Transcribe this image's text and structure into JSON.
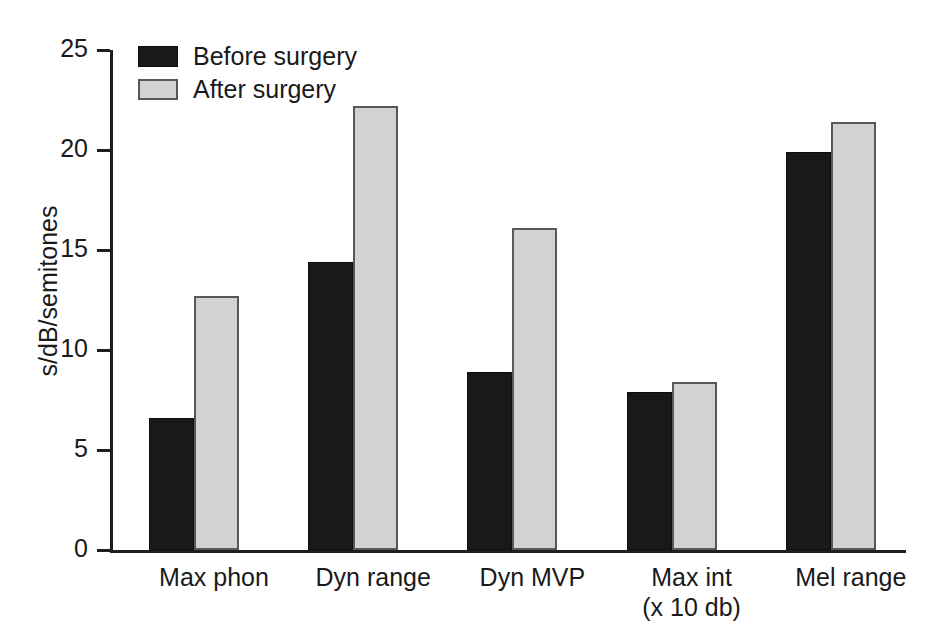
{
  "chart_data": {
    "type": "bar",
    "title": "",
    "xlabel": "",
    "ylabel": "s/dB/semitones",
    "ylim": [
      0,
      25
    ],
    "yticks": [
      0,
      5,
      10,
      15,
      20,
      25
    ],
    "ytick_labels": [
      "0",
      "5",
      "10",
      "15",
      "20",
      "25"
    ],
    "grid": false,
    "legend_position": "top-left",
    "categories": [
      "Max phon",
      "Dyn range",
      "Dyn MVP",
      "Max int",
      "Mel range"
    ],
    "category_sublabels": [
      "",
      "",
      "",
      "(x 10 db)",
      ""
    ],
    "series": [
      {
        "name": "Before surgery",
        "color": "#191919",
        "values": [
          6.6,
          14.4,
          8.9,
          7.9,
          19.9
        ]
      },
      {
        "name": "After surgery",
        "color": "#d2d2d2",
        "values": [
          12.7,
          22.2,
          16.1,
          8.4,
          21.4
        ]
      }
    ]
  },
  "legend": {
    "items": [
      {
        "label": "Before surgery"
      },
      {
        "label": "After surgery"
      }
    ]
  }
}
